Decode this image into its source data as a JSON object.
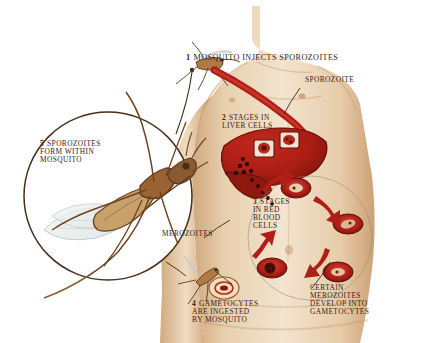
{
  "diagram": {
    "colors": {
      "skin_light": "#f2e2cc",
      "skin_mid": "#e3c8a4",
      "skin_shadow": "#c9a276",
      "blood_red": "#b01f16",
      "blood_dark": "#7e120c",
      "text_brown": "#3a2317",
      "line_brown": "#5a3a22",
      "mosquito_body": "#8a5a33",
      "mosquito_tan": "#c8a06a",
      "wing": "#e8eaea",
      "background": "#ffffff"
    },
    "steps": [
      {
        "num": "1",
        "lines": [
          "MOSQUITO INJECTS SPOROZOITES"
        ]
      },
      {
        "num": "2",
        "lines": [
          "STAGES IN",
          "LIVER CELLS"
        ]
      },
      {
        "num": "3",
        "lines": [
          "STAGES",
          "IN RED",
          "BLOOD",
          "CELLS"
        ]
      },
      {
        "num": "4",
        "lines": [
          "GAMETOCYTES",
          "ARE INGESTED",
          "BY MOSQUITO"
        ]
      },
      {
        "num": "5",
        "lines": [
          "SPOROZOITES",
          "FORM WITHIN",
          "MOSQUITO"
        ]
      }
    ],
    "annotations": [
      {
        "id": "sporozoite",
        "lines": [
          "SPOROZOITE"
        ]
      },
      {
        "id": "merozoites",
        "lines": [
          "MEROZOITES"
        ]
      },
      {
        "id": "certain-merozoites",
        "lines": [
          "CERTAIN",
          "MEROZOITES",
          "DEVELOP INTO",
          "GAMETOCYTES"
        ]
      }
    ]
  }
}
